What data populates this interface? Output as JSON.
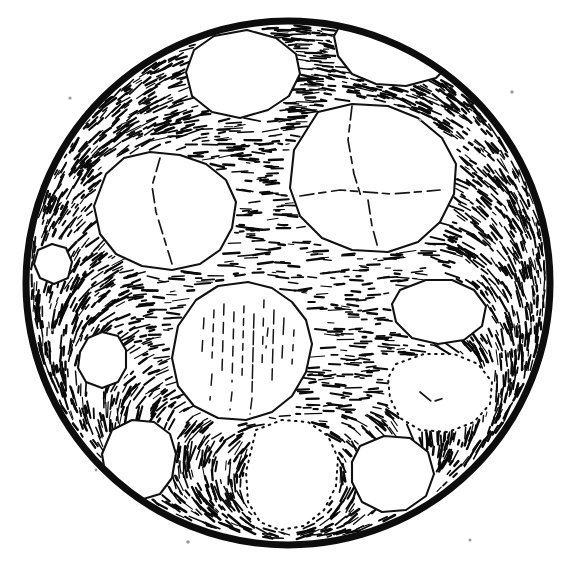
{
  "figure": {
    "kind": "scientific-illustration",
    "background_color": "#ffffff",
    "ink_color": "#111111",
    "aggregate_fill_color": "#ffffff",
    "has_text_labels": false,
    "has_scale_bar": false,
    "has_axes": false
  },
  "field_of_view": {
    "shape": "circle",
    "center_x": 288,
    "center_y": 283,
    "radius": 262,
    "rim_stroke_width": 7,
    "rim_color": "#0d0d0d"
  },
  "matrix": {
    "name": "groundmass-hatching",
    "texture": "short horizontal dash strokes, density increasing toward rim, strokes curving parallel to the circular boundary",
    "stroke_color": "#0a0a0a",
    "dash_count": 2300,
    "dash_min_length": 3,
    "dash_max_length": 17,
    "dash_min_width": 1.0,
    "dash_max_width": 2.6,
    "seed": 20250413
  },
  "aggregates": [
    {
      "id": "clast-top-left",
      "label": "upper-left small clast",
      "boundary": "solid",
      "points": "214,36 247,30 276,38 296,54 300,74 289,96 268,110 240,118 212,112 192,96 186,72 194,50",
      "cracks": [],
      "striations": []
    },
    {
      "id": "clast-top-right-rim",
      "label": "top-right clast touching rim",
      "boundary": "solid",
      "points": "343,20 372,15 404,18 430,29 448,44 452,62 436,78 406,86 376,84 352,74 338,56 334,36",
      "cracks": [],
      "striations": []
    },
    {
      "id": "clast-upper-left-large",
      "label": "large upper-left clast with single fracture",
      "boundary": "solid",
      "points": "106,174 124,158 150,152 180,155 206,164 226,180 236,202 232,228 220,250 200,264 172,270 142,266 116,254 100,234 94,206",
      "cracks": [
        "160,158 152,186 156,212 164,238 172,264"
      ],
      "striations": []
    },
    {
      "id": "clast-upper-right-large",
      "label": "large upper-right clast with branching fractures",
      "boundary": "solid",
      "points": "318,112 352,104 388,106 418,118 442,138 456,164 454,194 440,222 418,242 388,252 352,250 322,238 300,216 290,188 294,150",
      "cracks": [
        "352,106 348,140 354,174 362,200",
        "300,196 340,190 392,194 440,190",
        "368,200 372,226 378,248"
      ],
      "striations": []
    },
    {
      "id": "clast-left-small",
      "label": "small rounded left clast",
      "boundary": "solid",
      "points": "80,352 88,338 102,332 118,336 126,350 126,368 118,382 102,388 86,382 78,368",
      "cracks": [],
      "striations": []
    },
    {
      "id": "clast-center-foliated",
      "label": "large central clast with vertical foliation striations",
      "boundary": "solid",
      "points": "218,286 248,282 272,288 292,302 306,320 312,344 306,372 292,396 272,412 246,420 218,418 194,406 178,386 172,358 178,326 196,300",
      "cracks": [],
      "striations": [
        "204,318 202,352",
        "214,310 212,358",
        "224,304 222,372",
        "234,312 232,382",
        "244,306 242,376",
        "254,314 252,392",
        "264,300 262,366",
        "274,310 272,380",
        "284,318 282,358",
        "294,330 292,364",
        "212,374 210,400",
        "232,392 230,410",
        "252,398 250,414",
        "268,328 266,348"
      ]
    },
    {
      "id": "clast-right-upper",
      "label": "right-side upper clast",
      "boundary": "solid",
      "points": "400,290 426,280 452,280 474,290 486,306 482,326 464,340 438,344 412,338 396,322 392,304",
      "cracks": [],
      "striations": []
    },
    {
      "id": "clast-right-lower",
      "label": "right-side lower clast with dotted boundary",
      "boundary": "dotted",
      "points": "396,364 424,354 454,354 478,364 492,382 490,404 474,422 448,432 420,430 400,418 390,398 388,378",
      "cracks": [
        "420,392 432,402 444,398"
      ],
      "striations": []
    },
    {
      "id": "clast-lower-left-rim",
      "label": "lower-left clast touching rim",
      "boundary": "solid",
      "points": "112,430 132,420 154,422 170,434 176,454 172,478 160,494 140,500 120,494 106,478 102,454",
      "cracks": [],
      "striations": []
    },
    {
      "id": "clast-bottom-center",
      "label": "bottom-centre clast with dotted boundary",
      "boundary": "dotted",
      "points": "256,430 282,420 308,422 328,436 338,458 336,486 324,510 304,526 280,530 260,522 248,502 246,472",
      "cracks": [],
      "striations": []
    },
    {
      "id": "clast-bottom-right",
      "label": "bottom-right clast near rim",
      "boundary": "solid",
      "points": "360,446 384,436 410,438 428,452 434,474 426,496 406,510 382,512 362,502 352,482 352,462",
      "cracks": [],
      "striations": []
    },
    {
      "id": "clast-mid-left-edge",
      "label": "small clast at left rim",
      "boundary": "solid",
      "points": "38,250 52,244 66,248 72,262 68,278 54,284 40,278 34,264",
      "cracks": [],
      "striations": []
    }
  ],
  "stray_specks": [
    {
      "x": 70,
      "y": 98,
      "r": 1.6
    },
    {
      "x": 512,
      "y": 92,
      "r": 1.7
    },
    {
      "x": 534,
      "y": 298,
      "r": 1.5
    },
    {
      "x": 52,
      "y": 330,
      "r": 1.4
    },
    {
      "x": 188,
      "y": 542,
      "r": 1.8
    },
    {
      "x": 470,
      "y": 540,
      "r": 1.5
    },
    {
      "x": 96,
      "y": 470,
      "r": 1.4
    },
    {
      "x": 420,
      "y": 120,
      "r": 1.5
    }
  ]
}
